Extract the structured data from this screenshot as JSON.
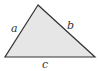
{
  "diagram": {
    "type": "triangle",
    "fill_color": "#e6e6e6",
    "stroke_color": "#333333",
    "vertices": {
      "top": [
        38,
        5
      ],
      "bottom_left": [
        5,
        57
      ],
      "bottom_right": [
        95,
        57
      ]
    },
    "labels": {
      "a": "a",
      "b": "b",
      "c": "c"
    }
  }
}
